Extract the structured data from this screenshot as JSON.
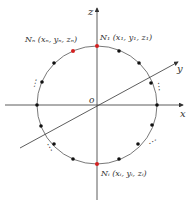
{
  "diagram": {
    "axes": {
      "x": "x",
      "y": "y",
      "z": "z",
      "origin": "o"
    },
    "labels": {
      "top": "N₁ (x₁, y₁, z₁)",
      "top_left": "Nₙ (xₙ, yₙ, zₙ)",
      "bottom": "Nᵢ (xᵢ, yᵢ, zᵢ)"
    },
    "ellipsis": "⋮",
    "colors": {
      "highlight": "#d42020",
      "point": "#111111",
      "line": "#333333"
    }
  }
}
